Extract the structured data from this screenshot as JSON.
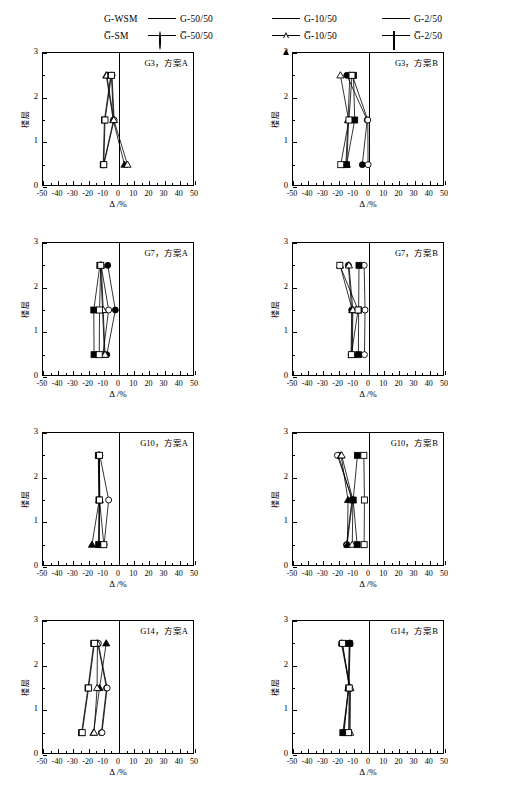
{
  "figure": {
    "title": "",
    "rows": 4,
    "cols": 2
  },
  "legend": {
    "entries": [
      {
        "head": "G-WSM",
        "label": "G-50/50",
        "marker": "circle-filled"
      },
      {
        "head": "G̅-SM",
        "label": "G̅-50/50",
        "marker": "circle-open"
      },
      {
        "head": "",
        "label": "G-10/50",
        "marker": "triangle-filled"
      },
      {
        "head": "",
        "label": "G̅-10/50",
        "marker": "triangle-open"
      },
      {
        "head": "",
        "label": "G-2/50",
        "marker": "square-filled"
      },
      {
        "head": "",
        "label": "G̅-2/50",
        "marker": "square-open"
      }
    ],
    "series_names": [
      "G-50/50",
      "G̅-50/50",
      "G-10/50",
      "G̅-10/50",
      "G-2/50",
      "G̅-2/50"
    ]
  },
  "axes": {
    "xlabel": "Δ /%",
    "ylabel": "楼层",
    "xlim": [
      -50,
      50
    ],
    "ylim": [
      0,
      3
    ],
    "xticks": [
      -50,
      -40,
      -30,
      -20,
      -10,
      0,
      10,
      20,
      30,
      40,
      50
    ],
    "xtick_labels": [
      "-50",
      "-40",
      "-30",
      "-20",
      "-10",
      "0",
      "10",
      "20",
      "30",
      "40",
      "50"
    ],
    "yticks": [
      0,
      1,
      2,
      3
    ],
    "ytick_labels": [
      "0",
      "1",
      "2",
      "3"
    ],
    "minor_x_step": 5,
    "minor_y_step": 0.5,
    "grid": false,
    "zero_reference_x": 0
  },
  "chart_data": [
    {
      "type": "line",
      "title": "G3，方案A",
      "xlabel": "Δ /%",
      "ylabel": "楼层",
      "xlim": [
        -50,
        50
      ],
      "ylim": [
        0,
        3
      ],
      "y": [
        0.5,
        1.5,
        2.5
      ],
      "series": [
        {
          "name": "G-50/50",
          "marker": "circle-filled",
          "values": [
            -10.2,
            -3.6,
            -5.0
          ]
        },
        {
          "name": "G̅-50/50",
          "marker": "circle-open",
          "values": [
            -10.0,
            -3.2,
            -4.6
          ]
        },
        {
          "name": "G-10/50",
          "marker": "triangle-filled",
          "values": [
            3.6,
            -3.8,
            -8.4
          ]
        },
        {
          "name": "G̅-10/50",
          "marker": "triangle-open",
          "values": [
            5.6,
            -3.4,
            -8.0
          ]
        },
        {
          "name": "G-2/50",
          "marker": "square-filled",
          "values": [
            -10.4,
            -9.6,
            -5.4
          ]
        },
        {
          "name": "G̅-2/50",
          "marker": "square-open",
          "values": [
            -10.0,
            -9.2,
            -5.0
          ]
        }
      ]
    },
    {
      "type": "line",
      "title": "G3，方案B",
      "xlabel": "Δ /%",
      "ylabel": "楼层",
      "xlim": [
        -50,
        50
      ],
      "ylim": [
        0,
        3
      ],
      "y": [
        0.5,
        1.5,
        2.5
      ],
      "series": [
        {
          "name": "G-50/50",
          "marker": "circle-filled",
          "values": [
            -4.4,
            -1.2,
            -14.6
          ]
        },
        {
          "name": "G̅-50/50",
          "marker": "circle-open",
          "values": [
            -0.6,
            -0.8,
            -11.0
          ]
        },
        {
          "name": "G-10/50",
          "marker": "triangle-filled",
          "values": [
            -15.2,
            -13.8,
            -12.6
          ]
        },
        {
          "name": "G̅-10/50",
          "marker": "triangle-open",
          "values": [
            -14.6,
            -13.4,
            -18.8
          ]
        },
        {
          "name": "G-2/50",
          "marker": "square-filled",
          "values": [
            -14.8,
            -9.4,
            -10.2
          ]
        },
        {
          "name": "G̅-2/50",
          "marker": "square-open",
          "values": [
            -18.6,
            -13.2,
            -11.2
          ]
        }
      ]
    },
    {
      "type": "line",
      "title": "G7，方案A",
      "xlabel": "Δ /%",
      "ylabel": "楼层",
      "xlim": [
        -50,
        50
      ],
      "ylim": [
        0,
        3
      ],
      "y": [
        0.5,
        1.5,
        2.5
      ],
      "series": [
        {
          "name": "G-50/50",
          "marker": "circle-filled",
          "values": [
            -8.0,
            -2.4,
            -7.4
          ]
        },
        {
          "name": "G̅-50/50",
          "marker": "circle-open",
          "values": [
            -10.6,
            -6.8,
            -11.8
          ]
        },
        {
          "name": "G-10/50",
          "marker": "triangle-filled",
          "values": [
            -9.6,
            -10.8,
            -12.2
          ]
        },
        {
          "name": "G̅-10/50",
          "marker": "triangle-open",
          "values": [
            -9.2,
            -10.4,
            -11.6
          ]
        },
        {
          "name": "G-2/50",
          "marker": "square-filled",
          "values": [
            -16.4,
            -16.6,
            -12.6
          ]
        },
        {
          "name": "G̅-2/50",
          "marker": "square-open",
          "values": [
            -13.0,
            -12.8,
            -12.0
          ]
        }
      ]
    },
    {
      "type": "line",
      "title": "G7，方案B",
      "xlabel": "Δ /%",
      "ylabel": "楼层",
      "xlim": [
        -50,
        50
      ],
      "ylim": [
        0,
        3
      ],
      "y": [
        0.5,
        1.5,
        2.5
      ],
      "series": [
        {
          "name": "G-50/50",
          "marker": "circle-filled",
          "values": [
            -11.8,
            -11.4,
            -13.6
          ]
        },
        {
          "name": "G̅-50/50",
          "marker": "circle-open",
          "values": [
            -3.0,
            -2.6,
            -3.2
          ]
        },
        {
          "name": "G-10/50",
          "marker": "triangle-filled",
          "values": [
            -11.4,
            -11.0,
            -19.0
          ]
        },
        {
          "name": "G̅-10/50",
          "marker": "triangle-open",
          "values": [
            -11.0,
            -10.6,
            -13.2
          ]
        },
        {
          "name": "G-2/50",
          "marker": "square-filled",
          "values": [
            -7.0,
            -6.8,
            -6.6
          ]
        },
        {
          "name": "G̅-2/50",
          "marker": "square-open",
          "values": [
            -11.6,
            -7.2,
            -19.2
          ]
        }
      ]
    },
    {
      "type": "line",
      "title": "G10，方案A",
      "xlabel": "Δ /%",
      "ylabel": "楼层",
      "xlim": [
        -50,
        50
      ],
      "ylim": [
        0,
        3
      ],
      "y": [
        0.5,
        1.5,
        2.5
      ],
      "series": [
        {
          "name": "G-50/50",
          "marker": "circle-filled",
          "values": [
            -13.0,
            -12.8,
            -13.2
          ]
        },
        {
          "name": "G̅-50/50",
          "marker": "circle-open",
          "values": [
            -9.8,
            -6.8,
            -12.6
          ]
        },
        {
          "name": "G-10/50",
          "marker": "triangle-filled",
          "values": [
            -17.8,
            -13.0,
            -13.4
          ]
        },
        {
          "name": "G̅-10/50",
          "marker": "triangle-open",
          "values": [
            -13.2,
            -12.6,
            -13.0
          ]
        },
        {
          "name": "G-2/50",
          "marker": "square-filled",
          "values": [
            -13.4,
            -13.2,
            -13.6
          ]
        },
        {
          "name": "G̅-2/50",
          "marker": "square-open",
          "values": [
            -10.0,
            -12.8,
            -12.8
          ]
        }
      ]
    },
    {
      "type": "line",
      "title": "G10，方案B",
      "xlabel": "Δ /%",
      "ylabel": "楼层",
      "xlim": [
        -50,
        50
      ],
      "ylim": [
        0,
        3
      ],
      "y": [
        0.5,
        1.5,
        2.5
      ],
      "series": [
        {
          "name": "G-50/50",
          "marker": "circle-filled",
          "values": [
            -14.8,
            -11.2,
            -20.2
          ]
        },
        {
          "name": "G̅-50/50",
          "marker": "circle-open",
          "values": [
            -14.4,
            -10.8,
            -20.8
          ]
        },
        {
          "name": "G-10/50",
          "marker": "triangle-filled",
          "values": [
            -14.2,
            -13.8,
            -18.4
          ]
        },
        {
          "name": "G̅-10/50",
          "marker": "triangle-open",
          "values": [
            -11.0,
            -10.6,
            -18.0
          ]
        },
        {
          "name": "G-2/50",
          "marker": "square-filled",
          "values": [
            -7.8,
            -10.4,
            -7.6
          ]
        },
        {
          "name": "G̅-2/50",
          "marker": "square-open",
          "values": [
            -3.2,
            -3.0,
            -3.4
          ]
        }
      ]
    },
    {
      "type": "line",
      "title": "G14，方案A",
      "xlabel": "Δ /%",
      "ylabel": "楼层",
      "xlim": [
        -50,
        50
      ],
      "ylim": [
        0,
        3
      ],
      "y": [
        0.5,
        1.5,
        2.5
      ],
      "series": [
        {
          "name": "G-50/50",
          "marker": "circle-filled",
          "values": [
            -11.6,
            -8.2,
            -14.0
          ]
        },
        {
          "name": "G̅-50/50",
          "marker": "circle-open",
          "values": [
            -11.2,
            -7.8,
            -13.6
          ]
        },
        {
          "name": "G-10/50",
          "marker": "triangle-filled",
          "values": [
            -16.8,
            -12.8,
            -8.4
          ]
        },
        {
          "name": "G̅-10/50",
          "marker": "triangle-open",
          "values": [
            -16.4,
            -14.4,
            -14.2
          ]
        },
        {
          "name": "G-2/50",
          "marker": "square-filled",
          "values": [
            -24.6,
            -20.4,
            -16.6
          ]
        },
        {
          "name": "G̅-2/50",
          "marker": "square-open",
          "values": [
            -24.2,
            -20.0,
            -16.2
          ]
        }
      ]
    },
    {
      "type": "line",
      "title": "G14，方案B",
      "xlabel": "Δ /%",
      "ylabel": "楼层",
      "xlim": [
        -50,
        50
      ],
      "ylim": [
        0,
        3
      ],
      "y": [
        0.5,
        1.5,
        2.5
      ],
      "series": [
        {
          "name": "G-50/50",
          "marker": "circle-filled",
          "values": [
            -16.8,
            -13.2,
            -12.4
          ]
        },
        {
          "name": "G̅-50/50",
          "marker": "circle-open",
          "values": [
            -13.0,
            -12.6,
            -18.2
          ]
        },
        {
          "name": "G-10/50",
          "marker": "triangle-filled",
          "values": [
            -16.4,
            -13.6,
            -12.8
          ]
        },
        {
          "name": "G̅-10/50",
          "marker": "triangle-open",
          "values": [
            -12.4,
            -12.2,
            -17.8
          ]
        },
        {
          "name": "G-2/50",
          "marker": "square-filled",
          "values": [
            -17.2,
            -13.4,
            -13.0
          ]
        },
        {
          "name": "G̅-2/50",
          "marker": "square-open",
          "values": [
            -13.4,
            -13.0,
            -17.4
          ]
        }
      ]
    }
  ],
  "style": {
    "line_color": "#000000",
    "axis_color": "#000000",
    "background": "#ffffff"
  }
}
